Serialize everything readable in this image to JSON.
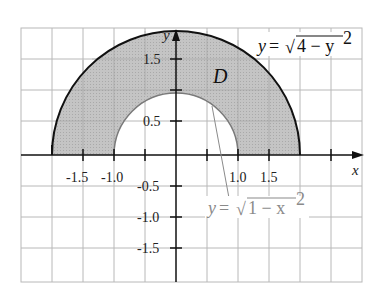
{
  "figure": {
    "type": "region-between-semicircles",
    "region_label": "D",
    "axes": {
      "x_label": "x",
      "y_label": "y",
      "x_ticks": [
        "-1.5",
        "-1.0",
        "1.0",
        "1.5"
      ],
      "y_ticks": [
        "1.5",
        "0.5",
        "-0.5",
        "-1.0",
        "-1.5"
      ]
    },
    "curves": {
      "outer": {
        "label_lhs": "y",
        "label_eq": "=",
        "label_radical": "4 − y",
        "label_exp": "2",
        "radius": 2
      },
      "inner": {
        "label_lhs": "y",
        "label_eq": "=",
        "label_radical": "1 − x",
        "label_exp": "2",
        "radius": 1
      }
    },
    "grid": {
      "spacing_units": 0.5,
      "x_range": [
        -2.5,
        3.0
      ],
      "y_range": [
        -2.0,
        2.0
      ]
    },
    "colors": {
      "shade": "#bdbdbd",
      "grid": "#b8b8b8",
      "axis": "#111111",
      "outer_curve": "#111111",
      "inner_curve": "#7a7a7a",
      "inner_label": "#8a8a8a"
    }
  }
}
